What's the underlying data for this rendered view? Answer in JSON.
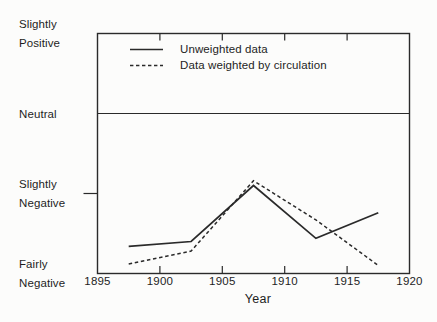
{
  "figure": {
    "background": "#fcfcfb",
    "ink_color": "#2a2a2a"
  },
  "chart_data": {
    "type": "line",
    "title": "",
    "xlabel": "Year",
    "ylabel": "",
    "xlim": [
      1895,
      1920
    ],
    "ylim": [
      -2,
      1
    ],
    "x_ticks": [
      1895,
      1900,
      1905,
      1910,
      1915,
      1920
    ],
    "y_categories": [
      {
        "label": "Slightly Positive",
        "value": 1
      },
      {
        "label": "Neutral",
        "value": 0
      },
      {
        "label": "Slightly Negative",
        "value": -1
      },
      {
        "label": "Fairly Negative",
        "value": -2
      }
    ],
    "left_axis_tick_values": [
      -1
    ],
    "neutral_reference_line": 0,
    "grid": false,
    "legend_position": "top-left-inside",
    "x": [
      1897.5,
      1902.5,
      1907.5,
      1912.5,
      1917.5
    ],
    "series": [
      {
        "name": "Unweighted data",
        "style": "solid",
        "values": [
          -1.66,
          -1.6,
          -0.9,
          -1.56,
          -1.24
        ]
      },
      {
        "name": "Data weighted by circulation",
        "style": "dashed",
        "values": [
          -1.88,
          -1.72,
          -0.84,
          -1.33,
          -1.9
        ]
      }
    ]
  }
}
